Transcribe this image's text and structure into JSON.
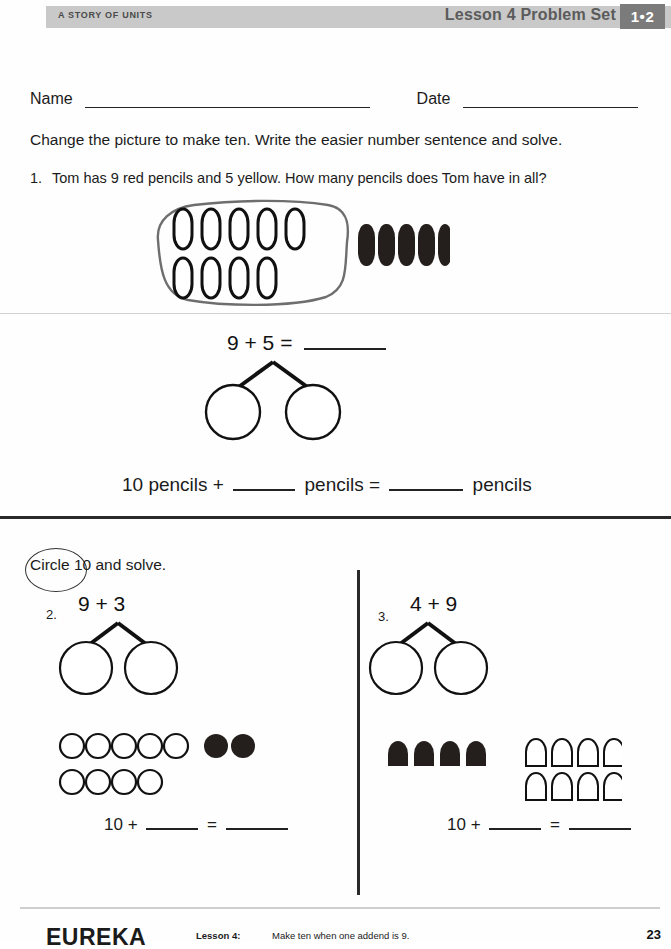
{
  "header": {
    "left_label": "A STORY OF UNITS",
    "title": "Lesson 4 Problem Set",
    "badge": "1•2"
  },
  "fields": {
    "name_label": "Name",
    "date_label": "Date"
  },
  "instruction": "Change the picture to make ten.  Write the easier number sentence and solve.",
  "problem1": {
    "number": "1.",
    "text": "Tom has 9 red pencils and 5 yellow.  How many pencils does Tom have in all?",
    "picture": {
      "outlined_pencils_row1": 5,
      "outlined_pencils_row2": 4,
      "filled_pencils": 5,
      "lasso_around": "outlined pencils"
    },
    "number_sentence": "9 + 5 =",
    "bond_circles": 2,
    "equation_parts": [
      "10 pencils +",
      "pencils =",
      "pencils"
    ]
  },
  "section2_instruction": "Circle 10 and solve.",
  "section2_circled_word": "Circle",
  "problem2": {
    "number": "2.",
    "expression": "9 + 3",
    "bond_circles": 2,
    "shapes": {
      "open_row1": 5,
      "open_row2": 4,
      "filled_row1": 3,
      "shape": "circle"
    },
    "equation_prefix": "10 +",
    "equation_equals": "="
  },
  "problem3": {
    "number": "3.",
    "expression": "4 + 9",
    "bond_circles": 2,
    "shapes": {
      "filled_row1": 4,
      "open_row1": 5,
      "open_row2": 4,
      "shape": "pencil"
    },
    "equation_prefix": "10 +",
    "equation_equals": "="
  },
  "footer": {
    "brand": "EUREKA",
    "lesson": "Lesson 4:",
    "description": "Make ten when one addend is 9.",
    "page": "23"
  },
  "colors": {
    "header_bar": "#c9c9c9",
    "badge_bg": "#7b7b7b",
    "ink": "#1b1b1b",
    "rule": "#2a2a2a"
  }
}
